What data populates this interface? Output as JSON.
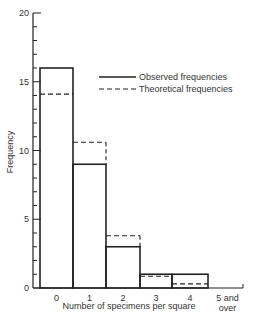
{
  "chart_data": {
    "type": "bar",
    "title": "",
    "xlabel": "Number of specimens per square",
    "ylabel": "Frequency",
    "ylim": [
      0,
      20
    ],
    "yticks_major": [
      0,
      5,
      10,
      15,
      20
    ],
    "yticks_minor_step": 1,
    "grid": false,
    "legend_position": "upper right",
    "categories": [
      "0",
      "1",
      "2",
      "3",
      "4",
      "5 and over"
    ],
    "series": [
      {
        "name": "Observed frequencies",
        "style": "solid",
        "values": [
          16,
          9,
          3,
          1,
          1,
          0
        ]
      },
      {
        "name": "Theoretical frequencies",
        "style": "dashed",
        "values": [
          14.1,
          10.6,
          3.8,
          0.85,
          0.3,
          0.1
        ]
      }
    ]
  },
  "axis": {
    "y_label": "Frequency",
    "x_label": "Number of specimens per square",
    "y_ticks": [
      "0",
      "5",
      "10",
      "15",
      "20"
    ],
    "x_ticks": [
      "0",
      "1",
      "2",
      "3",
      "4",
      "5 and",
      "over"
    ]
  },
  "legend": {
    "observed": "Observed frequencies",
    "theoretical": "Theoretical frequencies"
  },
  "colors": {
    "line": "#222222",
    "background": "#ffffff"
  }
}
